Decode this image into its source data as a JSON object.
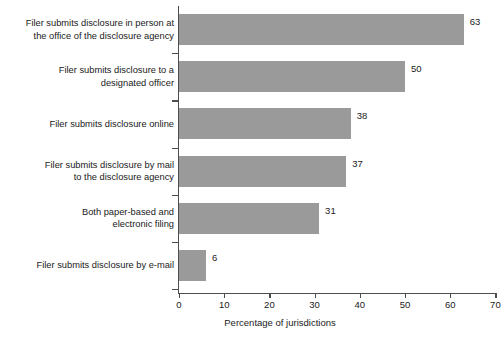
{
  "chart_data": {
    "type": "bar",
    "orientation": "horizontal",
    "title": "",
    "xlabel": "Percentage of jurisdictions",
    "ylabel": "",
    "xlim": [
      0,
      70
    ],
    "grid": false,
    "legend": null,
    "bar_color": "#9a9a9a",
    "axis_color": "#4d4d4d",
    "xticks": [
      0,
      10,
      20,
      30,
      40,
      50,
      60,
      70
    ],
    "xtick_labels": [
      "0",
      "10",
      "20",
      "30",
      "40",
      "50",
      "60",
      "70"
    ],
    "categories": [
      "Filer submits disclosure in person at\nthe office of the disclosure agency",
      "Filer submits disclosure to a\ndesignated officer",
      "Filer submits disclosure online",
      "Filer submits disclosure by mail\nto the disclosure agency",
      "Both paper-based and\nelectronic filing",
      "Filer submits disclosure by e-mail"
    ],
    "values": [
      63,
      50,
      38,
      37,
      31,
      6
    ],
    "value_labels": [
      "63",
      "50",
      "38",
      "37",
      "31",
      "6"
    ]
  }
}
